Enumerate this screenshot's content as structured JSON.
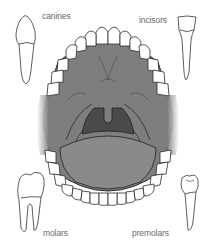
{
  "diagram": {
    "labels": {
      "canines": "canines",
      "incisors": "incisors",
      "molars": "molars",
      "premolars": "premolars"
    },
    "colors": {
      "background": "#ffffff",
      "palate": "#7e7e7e",
      "throat": "#4a4a4a",
      "tongue": "#8a8a8a",
      "tooth_fill": "#ffffff",
      "outline": "#333333",
      "label_text": "#6a6a6a"
    }
  }
}
